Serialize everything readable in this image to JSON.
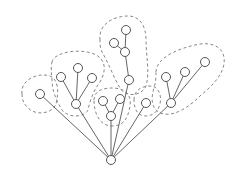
{
  "diagram": {
    "type": "tree-with-clusters",
    "colors": {
      "edge": "#555555",
      "node_stroke": "#555555",
      "node_fill": "#ffffff",
      "cluster_stroke": "#888888",
      "background": "#ffffff"
    },
    "node_radius": 4.5,
    "nodes": [
      {
        "id": "root",
        "x": 111,
        "y": 160
      },
      {
        "id": "a",
        "x": 40,
        "y": 94
      },
      {
        "id": "b",
        "x": 76,
        "y": 104
      },
      {
        "id": "b1",
        "x": 61,
        "y": 77
      },
      {
        "id": "b2",
        "x": 78,
        "y": 68
      },
      {
        "id": "b3",
        "x": 92,
        "y": 78
      },
      {
        "id": "c",
        "x": 129,
        "y": 80
      },
      {
        "id": "c1",
        "x": 125,
        "y": 52
      },
      {
        "id": "c2",
        "x": 114,
        "y": 43
      },
      {
        "id": "c3",
        "x": 126,
        "y": 30
      },
      {
        "id": "d",
        "x": 111,
        "y": 116
      },
      {
        "id": "d1",
        "x": 103,
        "y": 101
      },
      {
        "id": "d2",
        "x": 120,
        "y": 99
      },
      {
        "id": "e",
        "x": 146,
        "y": 103
      },
      {
        "id": "f",
        "x": 171,
        "y": 103
      },
      {
        "id": "f1",
        "x": 166,
        "y": 77
      },
      {
        "id": "f2",
        "x": 185,
        "y": 72
      },
      {
        "id": "f3",
        "x": 205,
        "y": 62
      }
    ],
    "edges": [
      [
        "root",
        "a"
      ],
      [
        "root",
        "b"
      ],
      [
        "root",
        "c"
      ],
      [
        "root",
        "d"
      ],
      [
        "root",
        "e"
      ],
      [
        "root",
        "f"
      ],
      [
        "b",
        "b1"
      ],
      [
        "b",
        "b2"
      ],
      [
        "b",
        "b3"
      ],
      [
        "c",
        "c1"
      ],
      [
        "c1",
        "c2"
      ],
      [
        "c1",
        "c3"
      ],
      [
        "d",
        "d1"
      ],
      [
        "d",
        "d2"
      ],
      [
        "f",
        "f1"
      ],
      [
        "f",
        "f2"
      ],
      [
        "f",
        "f3"
      ]
    ],
    "clusters": [
      {
        "id": "cluster-a",
        "path": "M22,94 C20,80 38,72 50,76 C60,80 58,96 56,104 C52,114 36,116 28,108 C24,104 22,100 22,94 Z"
      },
      {
        "id": "cluster-b",
        "path": "M52,62 C54,52 80,48 94,54 C104,58 108,68 100,82 C94,90 90,100 88,110 C84,118 68,118 62,110 C56,100 52,90 52,80 C51,72 51,66 52,62 Z"
      },
      {
        "id": "cluster-c",
        "path": "M100,40 C98,24 114,16 128,16 C140,16 146,26 146,40 C146,56 150,72 146,86 C142,96 126,98 120,88 C114,78 108,62 102,52 C100,48 100,44 100,40 Z"
      },
      {
        "id": "cluster-d",
        "path": "M94,100 C94,90 104,88 112,88 C122,88 132,92 130,106 C128,118 124,126 112,126 C100,126 94,114 94,100 Z"
      },
      {
        "id": "cluster-e",
        "path": "M134,100 C134,90 142,86 150,86 C158,86 162,94 160,104 C158,112 152,116 146,116 C138,116 134,110 134,100 Z"
      },
      {
        "id": "cluster-f",
        "path": "M156,72 C156,58 178,48 200,44 C216,42 226,50 224,64 C222,76 212,86 200,96 C190,106 176,116 164,114 C152,112 150,100 154,88 C156,82 156,76 156,72 Z"
      }
    ]
  }
}
